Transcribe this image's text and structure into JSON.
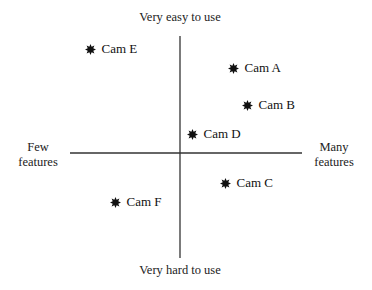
{
  "chart_data": {
    "type": "scatter",
    "title": "",
    "subtitle": "",
    "xlabel_left": "Few features",
    "xlabel_right": "Many features",
    "ylabel_top": "Very easy to use",
    "ylabel_bottom": "Very hard to use",
    "x_axis": {
      "name": "Features",
      "range": [
        -5,
        5
      ],
      "low": "Few features",
      "high": "Many features"
    },
    "y_axis": {
      "name": "Ease of use",
      "range": [
        -5,
        5
      ],
      "low": "Very hard to use",
      "high": "Very easy to use"
    },
    "grid": false,
    "legend": null,
    "marker": "8-point star",
    "points": [
      {
        "label": "Cam A",
        "x": 2.3,
        "y": 3.6
      },
      {
        "label": "Cam B",
        "x": 2.9,
        "y": 2.1
      },
      {
        "label": "Cam C",
        "x": 1.9,
        "y": -1.3
      },
      {
        "label": "Cam D",
        "x": 0.5,
        "y": 0.8
      },
      {
        "label": "Cam E",
        "x": -3.9,
        "y": 4.4
      },
      {
        "label": "Cam F",
        "x": -2.8,
        "y": -2.1
      }
    ]
  },
  "labels": {
    "top": "Very easy to use",
    "bottom": "Very hard to use",
    "left_line1": "Few",
    "left_line2": "features",
    "right_line1": "Many",
    "right_line2": "features"
  },
  "points": [
    {
      "label": "Cam A",
      "px": 233,
      "py": 68
    },
    {
      "label": "Cam B",
      "px": 247,
      "py": 105
    },
    {
      "label": "Cam C",
      "px": 225,
      "py": 183
    },
    {
      "label": "Cam D",
      "px": 192,
      "py": 134
    },
    {
      "label": "Cam E",
      "px": 90,
      "py": 49
    },
    {
      "label": "Cam F",
      "px": 115,
      "py": 202
    }
  ],
  "colors": {
    "axis": "#333333",
    "marker": "#111111",
    "text": "#222222",
    "background": "#ffffff"
  }
}
